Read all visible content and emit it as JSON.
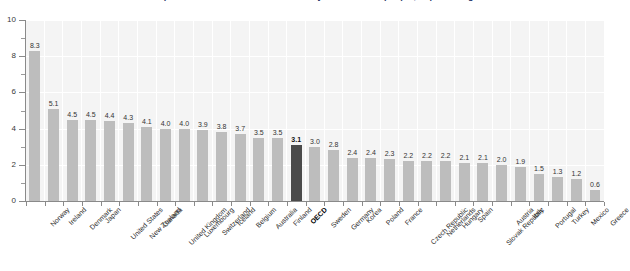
{
  "chart_data": {
    "type": "bar",
    "title": "Public social expenditure on services for the elderly and disabled people, in percentage of GDP",
    "xlabel": "",
    "ylabel": "",
    "ylim": [
      0,
      10
    ],
    "ytick_labels": [
      "0",
      "2",
      "4",
      "6",
      "8",
      "10"
    ],
    "ytick_values": [
      0,
      2,
      4,
      6,
      8,
      10
    ],
    "grid": true,
    "legend": "none",
    "highlight_category": "OECD",
    "highlight_color": "#4a4a4a",
    "bar_color": "#bdbdbd",
    "plot_background": "#f4f4f4",
    "categories": [
      "Norway",
      "Ireland",
      "Denmark",
      "Japan",
      "United States",
      "New Zealand",
      "Canada",
      "United Kingdom",
      "Luxembourg",
      "Switzerland",
      "Iceland",
      "Belgium",
      "Australia",
      "Finland",
      "OECD",
      "Sweden",
      "Germany",
      "Korea",
      "Poland",
      "France",
      "Czech Republic",
      "Netherlands",
      "Hungary",
      "Spain",
      "Slovak Republic",
      "Austria",
      "Italy",
      "Portugal",
      "Turkey",
      "Mexico",
      "Greece"
    ],
    "values": [
      8.3,
      5.1,
      4.5,
      4.5,
      4.4,
      4.3,
      4.1,
      4.0,
      4.0,
      3.9,
      3.8,
      3.7,
      3.5,
      3.5,
      3.1,
      3.0,
      2.8,
      2.4,
      2.4,
      2.3,
      2.2,
      2.2,
      2.2,
      2.1,
      2.1,
      2.0,
      1.9,
      1.5,
      1.3,
      1.2,
      0.6
    ],
    "value_labels": [
      "8.3",
      "5.1",
      "4.5",
      "4.5",
      "4.4",
      "4.3",
      "4.1",
      "4.0",
      "4.0",
      "3.9",
      "3.8",
      "3.7",
      "3.5",
      "3.5",
      "3.1",
      "3.0",
      "2.8",
      "2.4",
      "2.4",
      "2.3",
      "2.2",
      "2.2",
      "2.2",
      "2.1",
      "2.1",
      "2.0",
      "1.9",
      "1.5",
      "1.3",
      "1.2",
      "0.6"
    ]
  }
}
